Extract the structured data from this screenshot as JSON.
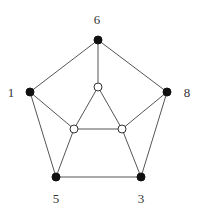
{
  "diagram": {
    "type": "graph",
    "nodes": [
      {
        "id": "6",
        "label": "6",
        "x": 98,
        "y": 40,
        "filled": true,
        "label_x": 97,
        "label_y": 24
      },
      {
        "id": "1",
        "label": "1",
        "x": 30,
        "y": 92,
        "filled": true,
        "label_x": 11,
        "label_y": 97
      },
      {
        "id": "8",
        "label": "8",
        "x": 167,
        "y": 92,
        "filled": true,
        "label_x": 187,
        "label_y": 97
      },
      {
        "id": "5",
        "label": "5",
        "x": 56,
        "y": 177,
        "filled": true,
        "label_x": 56,
        "label_y": 203
      },
      {
        "id": "3",
        "label": "3",
        "x": 141,
        "y": 177,
        "filled": true,
        "label_x": 141,
        "label_y": 203
      },
      {
        "id": "a",
        "label": "",
        "x": 98,
        "y": 87,
        "filled": false
      },
      {
        "id": "b",
        "label": "",
        "x": 74,
        "y": 129,
        "filled": false
      },
      {
        "id": "c",
        "label": "",
        "x": 122,
        "y": 129,
        "filled": false
      }
    ],
    "edges": [
      [
        "6",
        "1"
      ],
      [
        "6",
        "8"
      ],
      [
        "6",
        "a"
      ],
      [
        "1",
        "5"
      ],
      [
        "1",
        "b"
      ],
      [
        "8",
        "3"
      ],
      [
        "8",
        "c"
      ],
      [
        "5",
        "3"
      ],
      [
        "5",
        "b"
      ],
      [
        "3",
        "c"
      ],
      [
        "a",
        "b"
      ],
      [
        "a",
        "c"
      ],
      [
        "b",
        "c"
      ]
    ]
  }
}
